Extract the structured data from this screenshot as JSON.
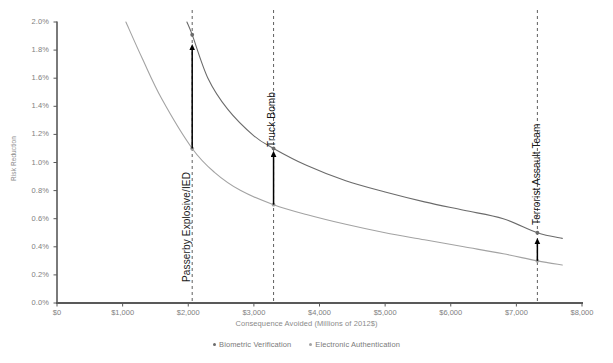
{
  "chart_data": {
    "type": "line",
    "title": "",
    "xlabel": "Consequence Avoided (Millions of 2012$)",
    "ylabel": "Risk Reduction",
    "xlim": [
      0,
      8000
    ],
    "ylim": [
      0,
      0.02
    ],
    "grid": false,
    "legend_position": "bottom",
    "x_tick_labels": [
      "$0",
      "$1,000",
      "$2,000",
      "$3,000",
      "$4,000",
      "$5,000",
      "$6,000",
      "$7,000",
      "$8,000"
    ],
    "x_tick_values": [
      0,
      1000,
      2000,
      3000,
      4000,
      5000,
      6000,
      7000,
      8000
    ],
    "y_tick_labels": [
      "0.0%",
      "0.2%",
      "0.4%",
      "0.6%",
      "0.8%",
      "1.0%",
      "1.2%",
      "1.4%",
      "1.6%",
      "1.8%",
      "2.0%"
    ],
    "y_tick_values": [
      0,
      0.002,
      0.004,
      0.006,
      0.008,
      0.01,
      0.012,
      0.014,
      0.016,
      0.018,
      0.02
    ],
    "series": [
      {
        "name": "Biometric Verification",
        "color": "#6b6b6b",
        "x": [
          1980,
          2060,
          2300,
          2600,
          3000,
          3300,
          3800,
          4400,
          5000,
          5600,
          6200,
          6800,
          7320,
          7700
        ],
        "values": [
          0.02,
          0.0191,
          0.016,
          0.0138,
          0.0119,
          0.011,
          0.0098,
          0.0087,
          0.0079,
          0.0072,
          0.0066,
          0.006,
          0.005,
          0.0046
        ]
      },
      {
        "name": "Electronic Authentication",
        "color": "#a3a3a3",
        "x": [
          1050,
          1300,
          1600,
          2060,
          2400,
          2800,
          3300,
          3800,
          4400,
          5000,
          5600,
          6200,
          6800,
          7320,
          7700
        ],
        "values": [
          0.02,
          0.0174,
          0.0145,
          0.011,
          0.0093,
          0.008,
          0.007,
          0.0063,
          0.0056,
          0.005,
          0.0045,
          0.004,
          0.0035,
          0.003,
          0.0027
        ]
      }
    ],
    "annotations": [
      {
        "label": "Passerby Explosive/IED",
        "x": 2060,
        "lower_value": 0.011,
        "upper_value": 0.0191,
        "arrow_top_value": 0.0182,
        "label_x_px": 181,
        "label_y_px": 282
      },
      {
        "label": "Truck Bomb",
        "x": 3300,
        "lower_value": 0.007,
        "upper_value": 0.011,
        "arrow_top_value": 0.0106,
        "label_x_px": 266,
        "label_y_px": 147
      },
      {
        "label": "Terrorist Assault Team",
        "x": 7320,
        "lower_value": 0.003,
        "upper_value": 0.005,
        "arrow_top_value": 0.0044,
        "label_x_px": 531,
        "label_y_px": 225
      }
    ],
    "marker_points": [
      {
        "series": "Biometric Verification",
        "x": 2060,
        "y": 0.0191
      },
      {
        "series": "Electronic Authentication",
        "x": 2060,
        "y": 0.011
      },
      {
        "series": "Biometric Verification",
        "x": 3300,
        "y": 0.011
      },
      {
        "series": "Electronic Authentication",
        "x": 3300,
        "y": 0.007
      },
      {
        "series": "Biometric Verification",
        "x": 7320,
        "y": 0.005
      },
      {
        "series": "Electronic Authentication",
        "x": 7320,
        "y": 0.003
      }
    ]
  },
  "legend": {
    "items": [
      {
        "label": "Biometric Verification",
        "color": "#6b6b6b"
      },
      {
        "label": "Electronic Authentication",
        "color": "#a3a3a3"
      }
    ]
  },
  "axes": {
    "y_title": "Risk Reduction",
    "x_title": "Consequence Avoided (Millions of 2012$)"
  },
  "colors": {
    "series_dark": "#6b6b6b",
    "series_light": "#a3a3a3",
    "axis": "#595959",
    "tick_text": "#808080",
    "annotation_text": "#1a1a1a",
    "arrow": "#000000",
    "dashed_line": "#4d4d4d"
  }
}
